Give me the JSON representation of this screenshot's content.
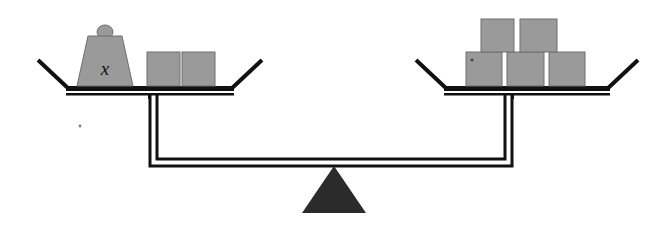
{
  "figure": {
    "background_color": "#ffffff",
    "width": 662,
    "height": 238
  },
  "colors": {
    "block_fill": "#9a9a9a",
    "block_stroke": "#6f6f6f",
    "weight_fill": "#9a9a9a",
    "weight_stroke": "#6f6f6f",
    "beam_stroke": "#111111",
    "beam_fill": "#ffffff",
    "fulcrum_fill": "#2b2b2b",
    "label_color": "#111111",
    "speck_color": "#7a7a7a"
  },
  "left_pan": {
    "name": "left-pan",
    "weight": {
      "label": "x",
      "shape": "trapezoid",
      "has_handle": true,
      "handle_shape": "dome"
    },
    "blocks": [
      {
        "id": "left-block-1"
      },
      {
        "id": "left-block-2"
      }
    ],
    "block_count": 2
  },
  "right_pan": {
    "name": "right-pan",
    "blocks_top": [
      {
        "id": "right-top-block-1"
      },
      {
        "id": "right-top-block-2"
      }
    ],
    "blocks_bottom": [
      {
        "id": "right-bottom-block-1"
      },
      {
        "id": "right-bottom-block-2"
      },
      {
        "id": "right-bottom-block-3"
      }
    ],
    "block_count": 5
  },
  "fulcrum": {
    "name": "fulcrum-triangle",
    "shape": "triangle"
  },
  "beam": {
    "name": "balance-beam",
    "style": "double-outline"
  },
  "artifacts": {
    "speck_left": "scan speck"
  }
}
